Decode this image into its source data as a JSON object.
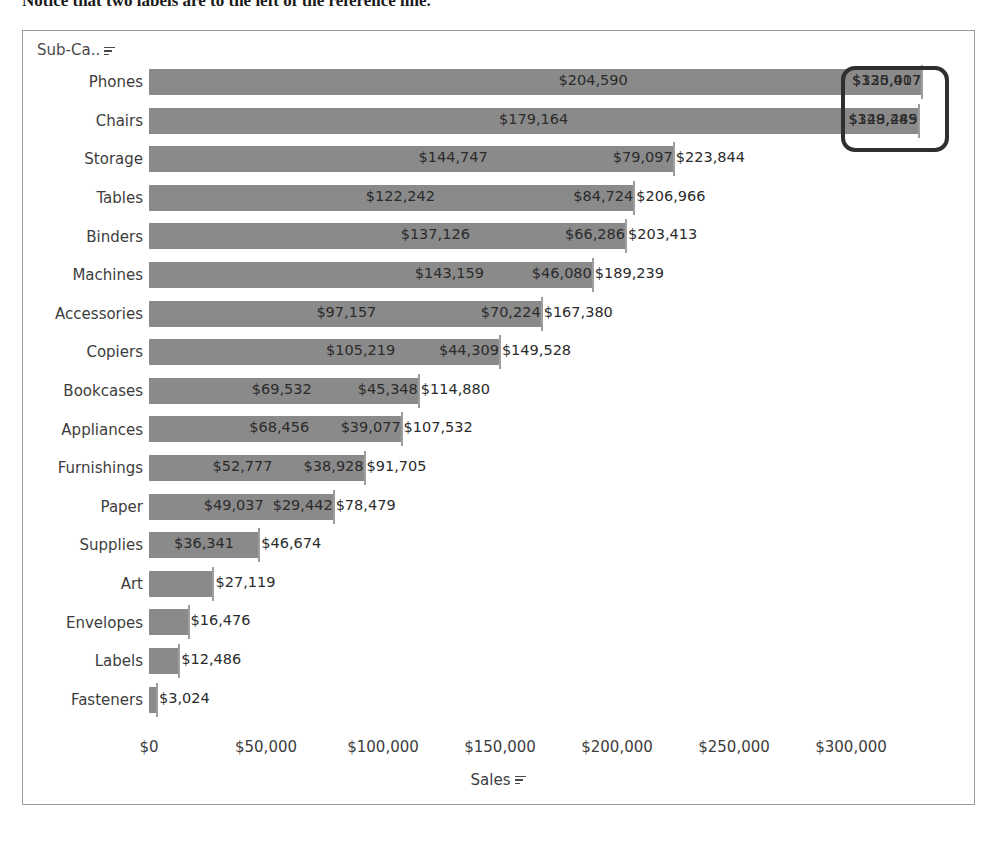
{
  "caption": "Notice that two labels are to the left of the reference line.",
  "chart_frame": {
    "row_field_label": "Sub-Ca..",
    "row_field_sort_icon": "sort-descending-icon",
    "x_axis_title": "Sales",
    "x_axis_sort_icon": "sort-descending-icon"
  },
  "chart_data": {
    "type": "bar",
    "orientation": "horizontal",
    "title": "",
    "xlabel": "Sales",
    "ylabel": "Sub-Ca..",
    "xlim": [
      0,
      340000
    ],
    "grid": false,
    "legend": null,
    "x_ticks": [
      "$0",
      "$50,000",
      "$100,000",
      "$150,000",
      "$200,000",
      "$250,000",
      "$300,000"
    ],
    "x_tick_values": [
      0,
      50000,
      100000,
      150000,
      200000,
      250000,
      300000
    ],
    "categories": [
      "Phones",
      "Chairs",
      "Storage",
      "Tables",
      "Binders",
      "Machines",
      "Accessories",
      "Copiers",
      "Bookcases",
      "Appliances",
      "Furnishings",
      "Paper",
      "Supplies",
      "Art",
      "Envelopes",
      "Labels",
      "Fasteners"
    ],
    "values": [
      330007,
      328449,
      223844,
      206966,
      203413,
      189239,
      167380,
      149528,
      114880,
      107532,
      91705,
      78479,
      83015,
      27119,
      16476,
      12486,
      3024
    ],
    "rows": [
      {
        "category": "Phones",
        "segment_1": "$204,590",
        "segment_1_value": 204590,
        "segment_2": "$125,417",
        "segment_2_value": 125417,
        "total": "$330,007",
        "total_value": 330007,
        "highlighted": true
      },
      {
        "category": "Chairs",
        "segment_1": "$179,164",
        "segment_1_value": 179164,
        "segment_2": "$149,285",
        "segment_2_value": 149285,
        "total": "$328,449",
        "total_value": 328449,
        "highlighted": true
      },
      {
        "category": "Storage",
        "segment_1": "$144,747",
        "segment_1_value": 144747,
        "segment_2": "$79,097",
        "segment_2_value": 79097,
        "total": "$223,844",
        "total_value": 223844,
        "highlighted": false
      },
      {
        "category": "Tables",
        "segment_1": "$122,242",
        "segment_1_value": 122242,
        "segment_2": "$84,724",
        "segment_2_value": 84724,
        "total": "$206,966",
        "total_value": 206966,
        "highlighted": false
      },
      {
        "category": "Binders",
        "segment_1": "$137,126",
        "segment_1_value": 137126,
        "segment_2": "$66,286",
        "segment_2_value": 66286,
        "total": "$203,413",
        "total_value": 203413,
        "highlighted": false
      },
      {
        "category": "Machines",
        "segment_1": "$143,159",
        "segment_1_value": 143159,
        "segment_2": "$46,080",
        "segment_2_value": 46080,
        "total": "$189,239",
        "total_value": 189239,
        "highlighted": false
      },
      {
        "category": "Accessories",
        "segment_1": "$97,157",
        "segment_1_value": 97157,
        "segment_2": "$70,224",
        "segment_2_value": 70224,
        "total": "$167,380",
        "total_value": 167380,
        "highlighted": false
      },
      {
        "category": "Copiers",
        "segment_1": "$105,219",
        "segment_1_value": 105219,
        "segment_2": "$44,309",
        "segment_2_value": 44309,
        "total": "$149,528",
        "total_value": 149528,
        "highlighted": false
      },
      {
        "category": "Bookcases",
        "segment_1": "$69,532",
        "segment_1_value": 69532,
        "segment_2": "$45,348",
        "segment_2_value": 45348,
        "total": "$114,880",
        "total_value": 114880,
        "highlighted": false
      },
      {
        "category": "Appliances",
        "segment_1": "$68,456",
        "segment_1_value": 68456,
        "segment_2": "$39,077",
        "segment_2_value": 39077,
        "total": "$107,532",
        "total_value": 107532,
        "highlighted": false
      },
      {
        "category": "Furnishings",
        "segment_1": "$52,777",
        "segment_1_value": 52777,
        "segment_2": "$38,928",
        "segment_2_value": 38928,
        "total": "$91,705",
        "total_value": 91705,
        "highlighted": false
      },
      {
        "category": "Paper",
        "segment_1": "$49,037",
        "segment_1_value": 49037,
        "segment_2": "$29,442",
        "segment_2_value": 29442,
        "total": "$78,479",
        "total_value": 78479,
        "highlighted": false
      },
      {
        "category": "Supplies",
        "segment_1": "$36,341",
        "segment_1_value": 36341,
        "segment_2": "",
        "segment_2_value": null,
        "total": "$46,674",
        "total_value": 46674,
        "highlighted": false
      },
      {
        "category": "Art",
        "segment_1": "",
        "segment_1_value": null,
        "segment_2": "",
        "segment_2_value": null,
        "total": "$27,119",
        "total_value": 27119,
        "highlighted": false
      },
      {
        "category": "Envelopes",
        "segment_1": "",
        "segment_1_value": null,
        "segment_2": "",
        "segment_2_value": null,
        "total": "$16,476",
        "total_value": 16476,
        "highlighted": false
      },
      {
        "category": "Labels",
        "segment_1": "",
        "segment_1_value": null,
        "segment_2": "",
        "segment_2_value": null,
        "total": "$12,486",
        "total_value": 12486,
        "highlighted": false
      },
      {
        "category": "Fasteners",
        "segment_1": "",
        "segment_1_value": null,
        "segment_2": "",
        "segment_2_value": null,
        "total": "$3,024",
        "total_value": 3024,
        "highlighted": false
      }
    ]
  },
  "colors": {
    "bar": "#8a8a8a",
    "tick": "#9e9e9e",
    "text": "#2b2b2b",
    "axis_text": "#3d3d3d",
    "frame_border": "#9a9a9a",
    "highlight_border": "#2f2f2f"
  }
}
